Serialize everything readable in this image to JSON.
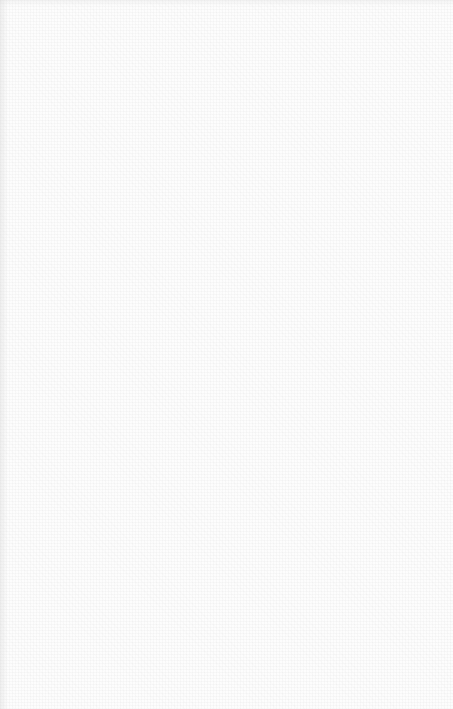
{
  "page": {
    "background_color": "#fdfdfd",
    "texture": "light-gray-crosshatch"
  }
}
